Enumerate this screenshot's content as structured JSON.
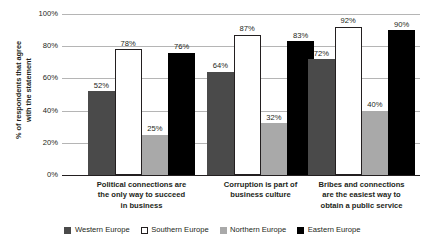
{
  "chart_data": {
    "type": "bar",
    "title": "",
    "subtitle": "",
    "xlabel": "",
    "ylabel": "% of respondents that agree with the statement",
    "ylabel_line1": "% of respondents that agree",
    "ylabel_line2": "with the statement",
    "ylim": [
      0,
      100
    ],
    "yticks": [
      "0%",
      "20%",
      "40%",
      "60%",
      "80%",
      "100%"
    ],
    "ytick_values": [
      0,
      20,
      40,
      60,
      80,
      100
    ],
    "grid": true,
    "legend_position": "bottom",
    "value_suffix": "%",
    "categories": [
      "Political connections are the only way to succeed in business",
      "Corruption is part of business culture",
      "Bribes and connections are the easiest way to obtain a public service"
    ],
    "category_lines": [
      [
        "Political connections are",
        "the only way to succeed",
        "in business"
      ],
      [
        "Corruption is part of",
        "business culture"
      ],
      [
        "Bribes and connections",
        "are the easiest way to",
        "obtain a public service"
      ]
    ],
    "series": [
      {
        "name": "Western Europe",
        "color": "#4a4a4a",
        "values": [
          52,
          64,
          72
        ],
        "labels": [
          "52%",
          "64%",
          "72%"
        ]
      },
      {
        "name": "Southern Europe",
        "color": "#ffffff",
        "values": [
          78,
          87,
          92
        ],
        "labels": [
          "78%",
          "87%",
          "92%"
        ]
      },
      {
        "name": "Northern Europe",
        "color": "#a9a9a9",
        "values": [
          25,
          32,
          40
        ],
        "labels": [
          "25%",
          "32%",
          "40%"
        ]
      },
      {
        "name": "Eastern Europe",
        "color": "#000000",
        "values": [
          76,
          83,
          90
        ],
        "labels": [
          "76%",
          "83%",
          "90%"
        ]
      }
    ]
  }
}
